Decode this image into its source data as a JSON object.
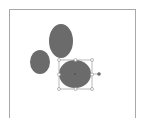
{
  "canvas": {
    "background": "#ffffff",
    "frame_border_color": "#a8a8a8"
  },
  "shapes": [
    {
      "type": "ellipse",
      "name": "top-ellipse",
      "cx": 61,
      "cy": 41,
      "rx": 12,
      "ry": 17,
      "fill": "#6b6b6b",
      "selected": false
    },
    {
      "type": "ellipse",
      "name": "left-ellipse",
      "cx": 40,
      "cy": 62,
      "rx": 10,
      "ry": 12,
      "fill": "#6b6b6b",
      "selected": false
    },
    {
      "type": "ellipse",
      "name": "selected-ellipse",
      "cx": 75,
      "cy": 74,
      "rx": 16,
      "ry": 14,
      "fill": "#6b6b6b",
      "selected": true
    }
  ],
  "selection": {
    "x": 59,
    "y": 60,
    "width": 33,
    "height": 29,
    "stroke": "#9a9a9a",
    "handle_fill": "#ffffff",
    "rotation_handle": {
      "cx": 99,
      "cy": 74,
      "fill": "#6b6b6b"
    }
  }
}
